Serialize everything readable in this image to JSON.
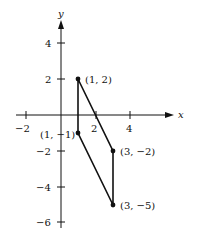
{
  "diagram": {
    "type": "coordinate-plane-polygon",
    "axes": {
      "x_label": "x",
      "y_label": "y",
      "x_ticks": [
        {
          "value": -2,
          "label": "−2"
        },
        {
          "value": 2,
          "label": "2"
        },
        {
          "value": 4,
          "label": "4"
        }
      ],
      "y_ticks": [
        {
          "value": 4,
          "label": "4"
        },
        {
          "value": 2,
          "label": "2"
        },
        {
          "value": -2,
          "label": "−2"
        },
        {
          "value": -4,
          "label": "−4"
        },
        {
          "value": -6,
          "label": "−6"
        }
      ]
    },
    "points": [
      {
        "x": 1,
        "y": 2,
        "label": "(1, 2)"
      },
      {
        "x": 1,
        "y": -1,
        "label": "(1, −1)"
      },
      {
        "x": 3,
        "y": -2,
        "label": "(3, −2)"
      },
      {
        "x": 3,
        "y": -5,
        "label": "(3, −5)"
      }
    ],
    "polygon_order": [
      "(1, 2)",
      "(3, -2)",
      "(3, -5)",
      "(1, -1)"
    ],
    "line_color": "#111111"
  }
}
